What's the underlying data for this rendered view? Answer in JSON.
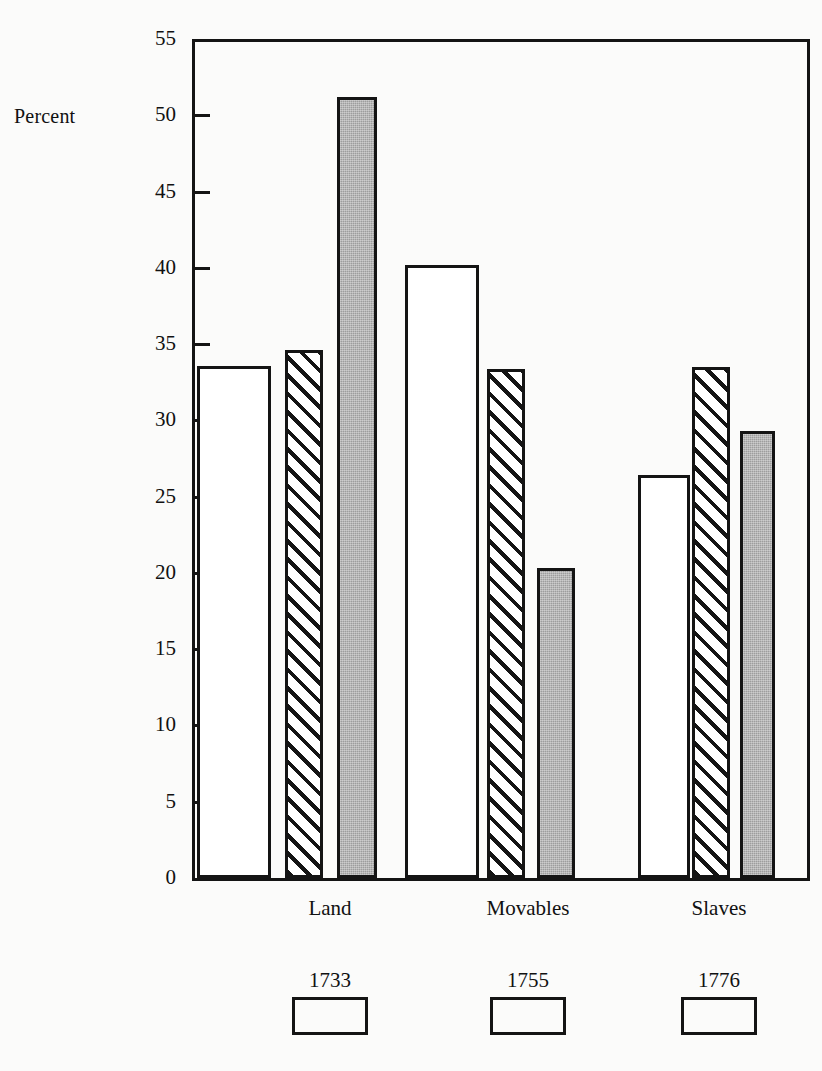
{
  "chart_data": {
    "type": "bar",
    "title": "",
    "subtitle": "",
    "xlabel": "",
    "ylabel": "Percent",
    "ylim": [
      0,
      55
    ],
    "ytick_values": [
      0,
      5,
      10,
      15,
      20,
      25,
      30,
      35,
      40,
      45,
      50,
      55
    ],
    "ytick_labels": [
      "0",
      "5",
      "10",
      "15",
      "20",
      "25",
      "30",
      "35",
      "40",
      "45",
      "50",
      "55"
    ],
    "grid": false,
    "legend_position": "bottom",
    "categories": [
      "Land",
      "Movables",
      "Slaves"
    ],
    "series": [
      {
        "name": "1733",
        "fill": "white",
        "values": [
          33.4,
          40.0,
          26.2
        ]
      },
      {
        "name": "1755",
        "fill": "hatch",
        "values": [
          34.4,
          33.2,
          33.3
        ]
      },
      {
        "name": "1776",
        "fill": "gray",
        "values": [
          51.0,
          20.1,
          29.1
        ]
      }
    ],
    "colors": {
      "ink": "#141414",
      "background": "#fbfbfa",
      "series_white": "#ffffff",
      "series_hatch": "#ffffff",
      "series_gray": "#9d9d9d"
    }
  },
  "legend": {
    "items": [
      {
        "label": "1733",
        "fill": "white"
      },
      {
        "label": "1755",
        "fill": "hatch"
      },
      {
        "label": "1776",
        "fill": "gray"
      }
    ]
  }
}
